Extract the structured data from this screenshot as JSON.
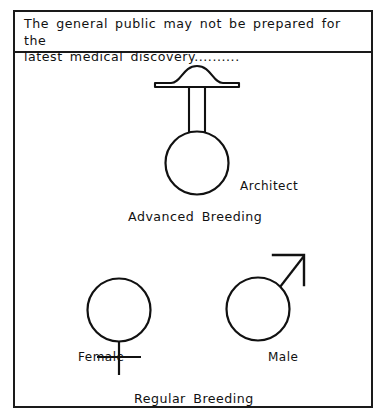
{
  "cartoon": {
    "caption": "The general public may not be prepared for the\nlatest medical discovery..........",
    "frame": {
      "border_color": "#1a1a1a",
      "background_color": "#ffffff"
    },
    "ink_color": "#111111",
    "figures": [
      {
        "id": "architect",
        "name": "architect-symbol",
        "description": "gender symbol: circle with vertical double-line stem topped by a wide brimmed hat",
        "label": "Architect",
        "circle": {
          "cx": 182,
          "cy": 108,
          "r": 31
        },
        "stem": {
          "x_left": 174,
          "x_right": 190,
          "y_top": 21,
          "y_bottom": 79
        },
        "hat": {
          "cx": 182,
          "cy": 21,
          "brim_half_width": 42,
          "dome_height": 14
        }
      },
      {
        "id": "female",
        "name": "female-symbol",
        "description": "gender symbol: circle with vertical stem and horizontal cross bar below",
        "label": "Female",
        "circle": {
          "cx": 104,
          "cy": 257,
          "r": 31
        },
        "stem": {
          "x": 104,
          "y_top": 288,
          "y_bottom": 320
        },
        "crossbar": {
          "y": 303,
          "x_left": 83,
          "x_right": 125
        }
      },
      {
        "id": "male",
        "name": "male-symbol",
        "description": "gender symbol: circle with diagonal arrow pointing upper-right with open corner arrowhead",
        "label": "Male",
        "circle": {
          "cx": 243,
          "cy": 256,
          "r": 31
        },
        "arrow": {
          "x1": 265,
          "y1": 234,
          "x2": 288,
          "y2": 202
        },
        "arrowhead": {
          "tip_x": 288,
          "tip_y": 202,
          "arm_left_x": 259,
          "arm_down_y": 231
        }
      }
    ],
    "group_labels": {
      "advanced_breeding": "Advanced  Breeding",
      "regular_breeding": "Regular  Breeding"
    }
  }
}
